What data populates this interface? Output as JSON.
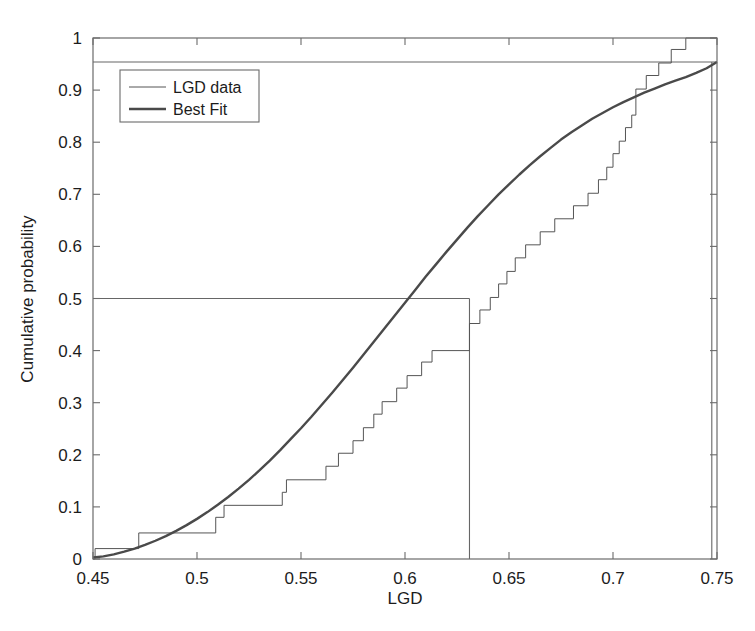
{
  "chart_data": {
    "type": "line",
    "title": "",
    "xlabel": "LGD",
    "ylabel": "Cumulative probability",
    "xlim": [
      0.45,
      0.75
    ],
    "ylim": [
      0,
      1
    ],
    "xticks": [
      "0.45",
      "0.5",
      "0.55",
      "0.6",
      "0.65",
      "0.7",
      "0.75"
    ],
    "xtick_values": [
      0.45,
      0.5,
      0.55,
      0.6,
      0.65,
      0.7,
      0.75
    ],
    "yticks": [
      "0",
      "0.1",
      "0.2",
      "0.3",
      "0.4",
      "0.5",
      "0.6",
      "0.7",
      "0.8",
      "0.9",
      "1"
    ],
    "ytick_values": [
      0,
      0.1,
      0.2,
      0.3,
      0.4,
      0.5,
      0.6,
      0.7,
      0.8,
      0.9,
      1.0
    ],
    "grid": false,
    "legend_position": "top-left",
    "series": [
      {
        "name": "LGD data",
        "style": "step",
        "color": "#555555",
        "linewidth": 1,
        "points": [
          [
            0.45,
            0.0
          ],
          [
            0.451,
            0.0
          ],
          [
            0.451,
            0.02
          ],
          [
            0.472,
            0.02
          ],
          [
            0.472,
            0.05
          ],
          [
            0.509,
            0.05
          ],
          [
            0.509,
            0.08
          ],
          [
            0.513,
            0.08
          ],
          [
            0.513,
            0.103
          ],
          [
            0.541,
            0.103
          ],
          [
            0.541,
            0.128
          ],
          [
            0.543,
            0.128
          ],
          [
            0.543,
            0.152
          ],
          [
            0.562,
            0.152
          ],
          [
            0.562,
            0.178
          ],
          [
            0.568,
            0.178
          ],
          [
            0.568,
            0.203
          ],
          [
            0.575,
            0.203
          ],
          [
            0.575,
            0.227
          ],
          [
            0.58,
            0.227
          ],
          [
            0.58,
            0.252
          ],
          [
            0.585,
            0.252
          ],
          [
            0.585,
            0.278
          ],
          [
            0.589,
            0.278
          ],
          [
            0.589,
            0.302
          ],
          [
            0.596,
            0.302
          ],
          [
            0.596,
            0.328
          ],
          [
            0.601,
            0.328
          ],
          [
            0.601,
            0.352
          ],
          [
            0.608,
            0.352
          ],
          [
            0.608,
            0.378
          ],
          [
            0.613,
            0.378
          ],
          [
            0.613,
            0.4
          ],
          [
            0.631,
            0.4
          ],
          [
            0.631,
            0.452
          ],
          [
            0.636,
            0.452
          ],
          [
            0.636,
            0.478
          ],
          [
            0.641,
            0.478
          ],
          [
            0.641,
            0.502
          ],
          [
            0.645,
            0.502
          ],
          [
            0.645,
            0.528
          ],
          [
            0.649,
            0.528
          ],
          [
            0.649,
            0.552
          ],
          [
            0.653,
            0.552
          ],
          [
            0.653,
            0.578
          ],
          [
            0.658,
            0.578
          ],
          [
            0.658,
            0.603
          ],
          [
            0.665,
            0.603
          ],
          [
            0.665,
            0.628
          ],
          [
            0.672,
            0.628
          ],
          [
            0.672,
            0.653
          ],
          [
            0.681,
            0.653
          ],
          [
            0.681,
            0.678
          ],
          [
            0.688,
            0.678
          ],
          [
            0.688,
            0.702
          ],
          [
            0.693,
            0.702
          ],
          [
            0.693,
            0.728
          ],
          [
            0.697,
            0.728
          ],
          [
            0.697,
            0.752
          ],
          [
            0.7,
            0.752
          ],
          [
            0.7,
            0.778
          ],
          [
            0.703,
            0.778
          ],
          [
            0.703,
            0.802
          ],
          [
            0.706,
            0.802
          ],
          [
            0.706,
            0.828
          ],
          [
            0.709,
            0.828
          ],
          [
            0.709,
            0.852
          ],
          [
            0.711,
            0.852
          ],
          [
            0.711,
            0.902
          ],
          [
            0.716,
            0.902
          ],
          [
            0.716,
            0.928
          ],
          [
            0.722,
            0.928
          ],
          [
            0.722,
            0.952
          ],
          [
            0.728,
            0.952
          ],
          [
            0.728,
            0.978
          ],
          [
            0.735,
            0.978
          ],
          [
            0.735,
            1.0
          ],
          [
            0.75,
            1.0
          ]
        ]
      },
      {
        "name": "Best Fit",
        "style": "smooth",
        "color": "#4a4a4a",
        "linewidth": 2.4,
        "points": [
          [
            0.45,
            0.003
          ],
          [
            0.455,
            0.005
          ],
          [
            0.46,
            0.009
          ],
          [
            0.465,
            0.014
          ],
          [
            0.47,
            0.02
          ],
          [
            0.475,
            0.027
          ],
          [
            0.48,
            0.035
          ],
          [
            0.485,
            0.044
          ],
          [
            0.49,
            0.054
          ],
          [
            0.495,
            0.065
          ],
          [
            0.5,
            0.077
          ],
          [
            0.505,
            0.09
          ],
          [
            0.51,
            0.104
          ],
          [
            0.515,
            0.119
          ],
          [
            0.52,
            0.135
          ],
          [
            0.525,
            0.152
          ],
          [
            0.53,
            0.17
          ],
          [
            0.535,
            0.189
          ],
          [
            0.54,
            0.209
          ],
          [
            0.545,
            0.23
          ],
          [
            0.55,
            0.251
          ],
          [
            0.555,
            0.273
          ],
          [
            0.56,
            0.296
          ],
          [
            0.565,
            0.319
          ],
          [
            0.57,
            0.343
          ],
          [
            0.575,
            0.367
          ],
          [
            0.58,
            0.392
          ],
          [
            0.585,
            0.417
          ],
          [
            0.59,
            0.442
          ],
          [
            0.595,
            0.467
          ],
          [
            0.6,
            0.492
          ],
          [
            0.605,
            0.517
          ],
          [
            0.61,
            0.542
          ],
          [
            0.615,
            0.566
          ],
          [
            0.62,
            0.59
          ],
          [
            0.625,
            0.613
          ],
          [
            0.63,
            0.636
          ],
          [
            0.635,
            0.658
          ],
          [
            0.64,
            0.679
          ],
          [
            0.645,
            0.7
          ],
          [
            0.65,
            0.719
          ],
          [
            0.655,
            0.738
          ],
          [
            0.66,
            0.756
          ],
          [
            0.665,
            0.773
          ],
          [
            0.67,
            0.789
          ],
          [
            0.675,
            0.805
          ],
          [
            0.68,
            0.819
          ],
          [
            0.685,
            0.832
          ],
          [
            0.69,
            0.845
          ],
          [
            0.695,
            0.856
          ],
          [
            0.7,
            0.867
          ],
          [
            0.705,
            0.877
          ],
          [
            0.71,
            0.886
          ],
          [
            0.715,
            0.895
          ],
          [
            0.72,
            0.903
          ],
          [
            0.725,
            0.911
          ],
          [
            0.73,
            0.918
          ],
          [
            0.735,
            0.925
          ],
          [
            0.74,
            0.933
          ],
          [
            0.745,
            0.942
          ],
          [
            0.75,
            0.954
          ]
        ]
      }
    ],
    "annotations": [
      {
        "name": "median-horizontal-line",
        "type": "hline",
        "y": 0.5,
        "x_from": 0.45,
        "x_to": 0.631,
        "color": "#666666"
      },
      {
        "name": "median-vertical-line",
        "type": "vline",
        "x": 0.631,
        "y_from": 0.0,
        "y_to": 0.5,
        "color": "#666666"
      },
      {
        "name": "upper-quantile-horizontal-line",
        "type": "hline",
        "y": 0.954,
        "x_from": 0.45,
        "x_to": 0.75,
        "color": "#666666"
      },
      {
        "name": "upper-quantile-vertical-line",
        "type": "vline",
        "x": 0.7475,
        "y_from": 0.0,
        "y_to": 0.954,
        "color": "#666666"
      }
    ]
  },
  "legend": {
    "entries": [
      {
        "label": "LGD data",
        "color": "#555555",
        "linewidth": 1
      },
      {
        "label": "Best Fit",
        "color": "#4a4a4a",
        "linewidth": 2.4
      }
    ]
  },
  "axes": {
    "x_title": "LGD",
    "y_title": "Cumulative probability",
    "frame_color": "#6b6b6b"
  },
  "colors": {
    "background": "#ffffff",
    "axis": "#6b6b6b",
    "text": "#1c1c1c",
    "data_line": "#555555",
    "fit_line": "#4a4a4a",
    "reference_line": "#666666"
  }
}
